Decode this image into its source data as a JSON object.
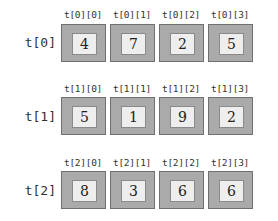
{
  "rows": [
    {
      "label": "t[0]",
      "cells": [
        {
          "label": "t[0][0]",
          "value": "4"
        },
        {
          "label": "t[0][1]",
          "value": "7"
        },
        {
          "label": "t[0][2]",
          "value": "2"
        },
        {
          "label": "t[0][3]",
          "value": "5"
        }
      ]
    },
    {
      "label": "t[1]",
      "cells": [
        {
          "label": "t[1][0]",
          "value": "5"
        },
        {
          "label": "t[1][1]",
          "value": "1"
        },
        {
          "label": "t[1][2]",
          "value": "9"
        },
        {
          "label": "t[1][3]",
          "value": "2"
        }
      ]
    },
    {
      "label": "t[2]",
      "cells": [
        {
          "label": "t[2][0]",
          "value": "8"
        },
        {
          "label": "t[2][1]",
          "value": "3"
        },
        {
          "label": "t[2][2]",
          "value": "6"
        },
        {
          "label": "t[2][3]",
          "value": "6"
        }
      ]
    }
  ],
  "colors": {
    "outer_fill": "#aaaaaa",
    "outer_border": "#707070",
    "inner_fill": "#eeeeee",
    "inner_border": "#8a8a8a"
  }
}
